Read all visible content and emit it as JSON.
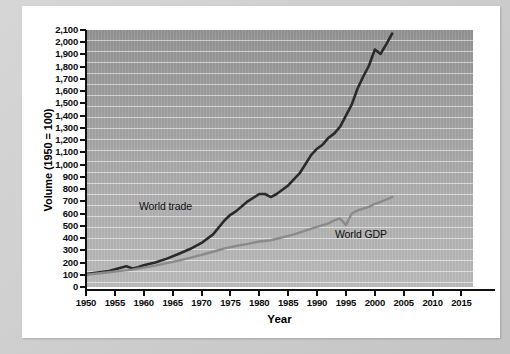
{
  "figure": {
    "background_color": "#cfcfcf",
    "card_color": "#ffffff",
    "plot_background_color": "#a0a0a0"
  },
  "chart_data": {
    "type": "line",
    "title": "",
    "xlabel": "Year",
    "ylabel": "Volume (1950 = 100)",
    "xlim": [
      1950,
      2017
    ],
    "ylim": [
      0,
      2100
    ],
    "ytick_step": 100,
    "xtick_step": 5,
    "grid": true,
    "gridlines": "horizontal",
    "legend_position": "inline-annotations",
    "xticks": [
      1950,
      1955,
      1960,
      1965,
      1970,
      1975,
      1980,
      1985,
      1990,
      1995,
      2000,
      2005,
      2010,
      2015
    ],
    "xtick_labels": [
      "1950",
      "1955",
      "1960",
      "1965",
      "1970",
      "1975",
      "1980",
      "1985",
      "1990",
      "1995",
      "2000",
      "2005",
      "2010",
      "2015"
    ],
    "yticks": [
      0,
      100,
      200,
      300,
      400,
      500,
      600,
      700,
      800,
      900,
      1000,
      1100,
      1200,
      1300,
      1400,
      1500,
      1600,
      1700,
      1800,
      1900,
      2000,
      2100
    ],
    "ytick_labels": [
      "0",
      "100",
      "200",
      "300",
      "400",
      "500",
      "600",
      "700",
      "800",
      "900",
      "1,000",
      "1,100",
      "1,200",
      "1,300",
      "1,400",
      "1,500",
      "1,600",
      "1,700",
      "1,800",
      "1,900",
      "2,000",
      "2,100"
    ],
    "series": [
      {
        "name": "World trade",
        "color": "#2a2a2a",
        "label_text": "World trade",
        "x": [
          1950,
          1952,
          1954,
          1956,
          1957,
          1958,
          1959,
          1960,
          1962,
          1964,
          1966,
          1968,
          1970,
          1972,
          1974,
          1975,
          1976,
          1978,
          1980,
          1981,
          1982,
          1983,
          1985,
          1987,
          1989,
          1990,
          1991,
          1992,
          1993,
          1994,
          1995,
          1996,
          1997,
          1998,
          1999,
          2000,
          2001,
          2002,
          2003
        ],
        "values": [
          105,
          118,
          130,
          158,
          170,
          152,
          162,
          178,
          200,
          232,
          270,
          310,
          360,
          430,
          545,
          590,
          620,
          700,
          760,
          760,
          735,
          760,
          830,
          930,
          1080,
          1130,
          1165,
          1220,
          1255,
          1310,
          1400,
          1490,
          1620,
          1720,
          1810,
          1940,
          1905,
          1985,
          2070
        ]
      },
      {
        "name": "World GDP",
        "color": "#8a8a8a",
        "label_text": "World GDP",
        "x": [
          1950,
          1952,
          1954,
          1956,
          1958,
          1960,
          1962,
          1964,
          1966,
          1968,
          1970,
          1972,
          1974,
          1976,
          1978,
          1980,
          1982,
          1984,
          1986,
          1988,
          1990,
          1992,
          1993,
          1994,
          1995,
          1996,
          1997,
          1998,
          1999,
          2000,
          2001,
          2002,
          2003
        ],
        "values": [
          100,
          110,
          120,
          132,
          142,
          158,
          175,
          195,
          215,
          238,
          262,
          288,
          315,
          335,
          352,
          372,
          382,
          405,
          430,
          460,
          492,
          520,
          545,
          560,
          505,
          600,
          625,
          640,
          655,
          680,
          695,
          715,
          735
        ]
      }
    ]
  }
}
